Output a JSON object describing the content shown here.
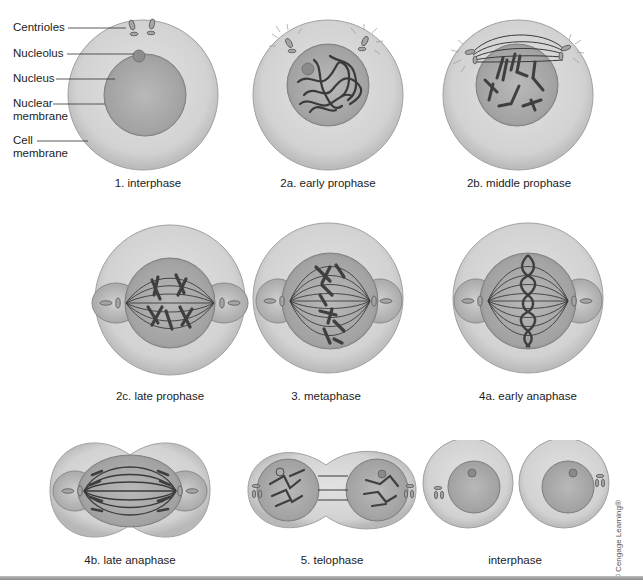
{
  "figure": {
    "colors": {
      "cytoplasm": "#d4d4d4",
      "cytoplasm_edge": "#a8a8a8",
      "nucleus": "#a9a9a9",
      "nucleus_edge": "#7a7a7a",
      "chromosome": "#4a4a4a",
      "spindle": "#3c3c3c",
      "aster": "#bdbdbd"
    },
    "labels": {
      "centrioles": "Centrioles",
      "nucleolus": "Nucleolus",
      "nucleus": "Nucleus",
      "nuclear_membrane_line1": "Nuclear",
      "nuclear_membrane_line2": "membrane",
      "cell_membrane_line1": "Cell",
      "cell_membrane_line2": "membrane"
    },
    "stages": [
      {
        "id": "interphase-1",
        "caption": "1. interphase"
      },
      {
        "id": "early-prophase",
        "caption": "2a. early prophase"
      },
      {
        "id": "middle-prophase",
        "caption": "2b. middle prophase"
      },
      {
        "id": "late-prophase",
        "caption": "2c. late prophase"
      },
      {
        "id": "metaphase",
        "caption": "3. metaphase"
      },
      {
        "id": "early-anaphase",
        "caption": "4a. early anaphase"
      },
      {
        "id": "late-anaphase",
        "caption": "4b. late anaphase"
      },
      {
        "id": "telophase",
        "caption": "5. telophase"
      },
      {
        "id": "interphase-2",
        "caption": "interphase"
      }
    ],
    "copyright": "© Cengage Learning®"
  }
}
